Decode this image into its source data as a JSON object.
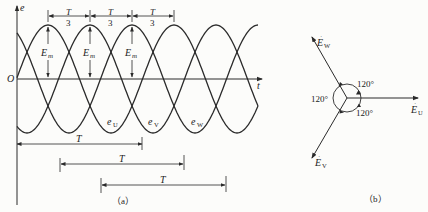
{
  "figure_a": {
    "caption": "（a）",
    "y_axis_label": "e",
    "x_axis_label": "t",
    "origin_label": "O",
    "amplitude_label": "E",
    "amplitude_sub": "m",
    "phase_gap_num": "T",
    "phase_gap_den": "3",
    "period_label": "T",
    "curves": [
      {
        "name": "e",
        "sub": "U"
      },
      {
        "name": "e",
        "sub": "V"
      },
      {
        "name": "e",
        "sub": "W"
      }
    ]
  },
  "figure_b": {
    "caption": "（b）",
    "phasors": [
      {
        "name": "E",
        "sub": "U"
      },
      {
        "name": "E",
        "sub": "V"
      },
      {
        "name": "E",
        "sub": "W"
      }
    ],
    "angles": [
      "120°",
      "120°",
      "120°"
    ]
  },
  "colors": {
    "ink": "#2a2a2a",
    "background": "#fcfcfa"
  }
}
